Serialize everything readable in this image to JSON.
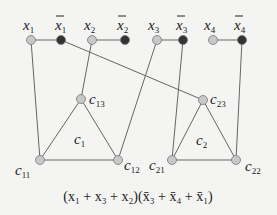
{
  "diagram": {
    "colors": {
      "true_node": "#c8c8c8",
      "false_node": "#333333",
      "edge": "#666666"
    },
    "variable_nodes": [
      {
        "id": "x1",
        "label": "x",
        "sub": "1",
        "bar": false,
        "x": 31,
        "y": 40
      },
      {
        "id": "nx1",
        "label": "x",
        "sub": "1",
        "bar": true,
        "x": 61,
        "y": 40
      },
      {
        "id": "x2",
        "label": "x",
        "sub": "2",
        "bar": false,
        "x": 92,
        "y": 40
      },
      {
        "id": "nx2",
        "label": "x",
        "sub": "2",
        "bar": true,
        "x": 125,
        "y": 40
      },
      {
        "id": "x3",
        "label": "x",
        "sub": "3",
        "bar": false,
        "x": 157,
        "y": 40
      },
      {
        "id": "nx3",
        "label": "x",
        "sub": "3",
        "bar": true,
        "x": 183,
        "y": 40
      },
      {
        "id": "x4",
        "label": "x",
        "sub": "4",
        "bar": false,
        "x": 213,
        "y": 40
      },
      {
        "id": "nx4",
        "label": "x",
        "sub": "4",
        "bar": true,
        "x": 242,
        "y": 40
      }
    ],
    "clause_nodes": [
      {
        "id": "c11",
        "label": "c",
        "sub": "11",
        "x": 40,
        "y": 160
      },
      {
        "id": "c12",
        "label": "c",
        "sub": "12",
        "x": 118,
        "y": 160
      },
      {
        "id": "c13",
        "label": "c",
        "sub": "13",
        "x": 81,
        "y": 99
      },
      {
        "id": "c21",
        "label": "c",
        "sub": "21",
        "x": 172,
        "y": 160
      },
      {
        "id": "c22",
        "label": "c",
        "sub": "22",
        "x": 236,
        "y": 160
      },
      {
        "id": "c23",
        "label": "c",
        "sub": "23",
        "x": 203,
        "y": 100
      }
    ],
    "triangle_labels": [
      {
        "label": "c",
        "sub": "1",
        "x": 77,
        "y": 144
      },
      {
        "label": "c",
        "sub": "2",
        "x": 197,
        "y": 145
      }
    ],
    "formula": "(x₁ + x₃ + x₂)(x̄₃ + x̄₄ + x̄₁)"
  }
}
